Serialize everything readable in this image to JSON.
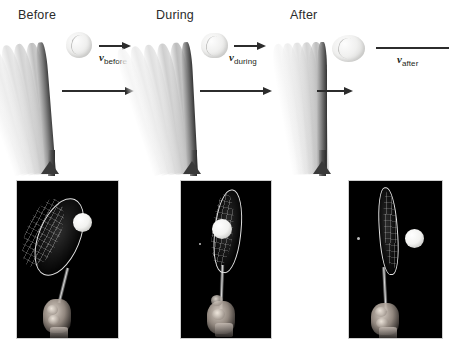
{
  "figure": {
    "title_visible": false,
    "background_color": "#ffffff",
    "ink_color": "#231f20"
  },
  "panels": [
    {
      "id": "before",
      "label": "Before",
      "ball": {
        "state": "round",
        "caption_symbol": "v",
        "caption_subscript": "before"
      },
      "ball_arrow": {
        "length_px": 30,
        "direction": "right",
        "meaning": "ball velocity before impact"
      },
      "racket_arrow": {
        "length_px": 70,
        "direction": "right",
        "meaning": "racket velocity before impact"
      },
      "racket": {
        "orientation": "tilted-right",
        "motion_blur": true,
        "contact": false
      },
      "photo": {
        "description": "tennis racket swinging toward ball on black background",
        "ball_contact": false
      }
    },
    {
      "id": "during",
      "label": "During",
      "ball": {
        "state": "compressed",
        "caption_symbol": "v",
        "caption_subscript": "during"
      },
      "ball_arrow": {
        "length_px": 30,
        "direction": "right",
        "meaning": "ball velocity during impact"
      },
      "racket_arrow": {
        "length_px": 70,
        "direction": "right",
        "meaning": "racket velocity during impact"
      },
      "racket": {
        "orientation": "tilted-right",
        "motion_blur": true,
        "contact": true
      },
      "photo": {
        "description": "ball pressed into racket strings which bend backward",
        "ball_contact": true
      }
    },
    {
      "id": "after",
      "label": "After",
      "ball": {
        "state": "elongated",
        "caption_symbol": "v",
        "caption_subscript": "after"
      },
      "ball_arrow": {
        "length_px": 82,
        "direction": "right",
        "meaning": "ball velocity after impact (fastest)"
      },
      "racket_arrow": {
        "length_px": 34,
        "direction": "right",
        "meaning": "racket velocity after impact (slowed)"
      },
      "racket": {
        "orientation": "near-vertical",
        "motion_blur": true,
        "contact": false
      },
      "photo": {
        "description": "ball leaving the racket to the right after rebound",
        "ball_contact": false
      }
    }
  ],
  "labels": {
    "v_symbol": "v",
    "subscripts": [
      "before",
      "during",
      "after"
    ]
  }
}
